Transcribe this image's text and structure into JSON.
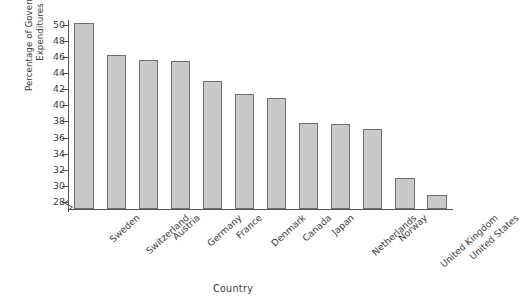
{
  "chart_data": {
    "type": "bar",
    "title": "",
    "xlabel": "Country",
    "ylabel": "Percentage of Government\nExpenditures",
    "ylim": [
      27,
      50.6
    ],
    "ytick_start": 28,
    "ytick_end": 50,
    "ytick_step": 2,
    "yticks": [
      28,
      30,
      32,
      34,
      36,
      38,
      40,
      42,
      44,
      46,
      48,
      50
    ],
    "grid": false,
    "legend": "none",
    "axis_break": true,
    "axis_break_note": "zigzag break on y-axis below 28",
    "categories": [
      "Sweden",
      "Switzerland",
      "Austria",
      "Germany",
      "France",
      "Denmark",
      "Canada",
      "Japan",
      "Netherlands",
      "Norway",
      "United Kingdom",
      "United States"
    ],
    "values": [
      50.1,
      46.1,
      45.5,
      45.4,
      42.9,
      41.3,
      40.8,
      37.7,
      37.6,
      36.9,
      30.9,
      28.8
    ],
    "bar_color": "#c9c9c9",
    "bar_border_color": "#6f6f6f"
  }
}
